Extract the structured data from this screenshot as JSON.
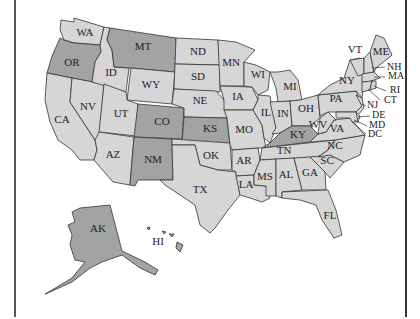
{
  "map": {
    "title": "",
    "colors": {
      "highlighted": "#a3a3a3",
      "default": "#d6d6d6",
      "border": "#333333",
      "background": "#ffffff"
    },
    "highlighted_states": [
      "OR",
      "MT",
      "CO",
      "KS",
      "NM",
      "KY",
      "AK",
      "HI"
    ],
    "states": [
      {
        "abbr": "WA",
        "label": "WA",
        "x": 85,
        "y": 36
      },
      {
        "abbr": "OR",
        "label": "OR",
        "x": 72,
        "y": 66
      },
      {
        "abbr": "CA",
        "label": "CA",
        "x": 62,
        "y": 123
      },
      {
        "abbr": "NV",
        "label": "NV",
        "x": 88,
        "y": 110
      },
      {
        "abbr": "ID",
        "label": "ID",
        "x": 111,
        "y": 76
      },
      {
        "abbr": "MT",
        "label": "MT",
        "x": 143,
        "y": 50
      },
      {
        "abbr": "WY",
        "label": "WY",
        "x": 151,
        "y": 88
      },
      {
        "abbr": "UT",
        "label": "UT",
        "x": 121,
        "y": 117
      },
      {
        "abbr": "AZ",
        "label": "AZ",
        "x": 113,
        "y": 158
      },
      {
        "abbr": "CO",
        "label": "CO",
        "x": 162,
        "y": 125
      },
      {
        "abbr": "NM",
        "label": "NM",
        "x": 153,
        "y": 163
      },
      {
        "abbr": "ND",
        "label": "ND",
        "x": 198,
        "y": 55
      },
      {
        "abbr": "SD",
        "label": "SD",
        "x": 198,
        "y": 80
      },
      {
        "abbr": "NE",
        "label": "NE",
        "x": 200,
        "y": 104
      },
      {
        "abbr": "KS",
        "label": "KS",
        "x": 210,
        "y": 132
      },
      {
        "abbr": "OK",
        "label": "OK",
        "x": 211,
        "y": 159
      },
      {
        "abbr": "TX",
        "label": "TX",
        "x": 200,
        "y": 193
      },
      {
        "abbr": "MN",
        "label": "MN",
        "x": 231,
        "y": 66
      },
      {
        "abbr": "IA",
        "label": "IA",
        "x": 238,
        "y": 100
      },
      {
        "abbr": "MO",
        "label": "MO",
        "x": 244,
        "y": 133
      },
      {
        "abbr": "AR",
        "label": "AR",
        "x": 244,
        "y": 164
      },
      {
        "abbr": "LA",
        "label": "LA",
        "x": 246,
        "y": 188
      },
      {
        "abbr": "WI",
        "label": "WI",
        "x": 258,
        "y": 78
      },
      {
        "abbr": "IL",
        "label": "IL",
        "x": 266,
        "y": 116
      },
      {
        "abbr": "MI",
        "label": "MI",
        "x": 290,
        "y": 90
      },
      {
        "abbr": "IN",
        "label": "IN",
        "x": 283,
        "y": 117
      },
      {
        "abbr": "OH",
        "label": "OH",
        "x": 306,
        "y": 112
      },
      {
        "abbr": "KY",
        "label": "KY",
        "x": 298,
        "y": 138
      },
      {
        "abbr": "TN",
        "label": "TN",
        "x": 284,
        "y": 154
      },
      {
        "abbr": "MS",
        "label": "MS",
        "x": 265,
        "y": 180
      },
      {
        "abbr": "AL",
        "label": "AL",
        "x": 286,
        "y": 178
      },
      {
        "abbr": "GA",
        "label": "GA",
        "x": 310,
        "y": 176
      },
      {
        "abbr": "FL",
        "label": "FL",
        "x": 330,
        "y": 219
      },
      {
        "abbr": "SC",
        "label": "SC",
        "x": 327,
        "y": 164
      },
      {
        "abbr": "NC",
        "label": "NC",
        "x": 335,
        "y": 149
      },
      {
        "abbr": "VA",
        "label": "VA",
        "x": 337,
        "y": 132
      },
      {
        "abbr": "WV",
        "label": "WV",
        "x": 318,
        "y": 128
      },
      {
        "abbr": "PA",
        "label": "PA",
        "x": 336,
        "y": 102
      },
      {
        "abbr": "NY",
        "label": "NY",
        "x": 347,
        "y": 84
      },
      {
        "abbr": "VT",
        "label": "VT",
        "x": 355,
        "y": 53
      },
      {
        "abbr": "ME",
        "label": "ME",
        "x": 381,
        "y": 55
      },
      {
        "abbr": "NH",
        "label": "NH",
        "x": 387,
        "y": 70
      },
      {
        "abbr": "MA",
        "label": "MA",
        "x": 388,
        "y": 79
      },
      {
        "abbr": "RI",
        "label": "RI",
        "x": 390,
        "y": 93
      },
      {
        "abbr": "CT",
        "label": "CT",
        "x": 384,
        "y": 103
      },
      {
        "abbr": "NJ",
        "label": "NJ",
        "x": 367,
        "y": 108
      },
      {
        "abbr": "DE",
        "label": "DE",
        "x": 372,
        "y": 118
      },
      {
        "abbr": "MD",
        "label": "MD",
        "x": 369,
        "y": 128
      },
      {
        "abbr": "DC",
        "label": "DC",
        "x": 368,
        "y": 137
      },
      {
        "abbr": "AK",
        "label": "AK",
        "x": 98,
        "y": 232
      },
      {
        "abbr": "HI",
        "label": "HI",
        "x": 158,
        "y": 245
      }
    ]
  }
}
